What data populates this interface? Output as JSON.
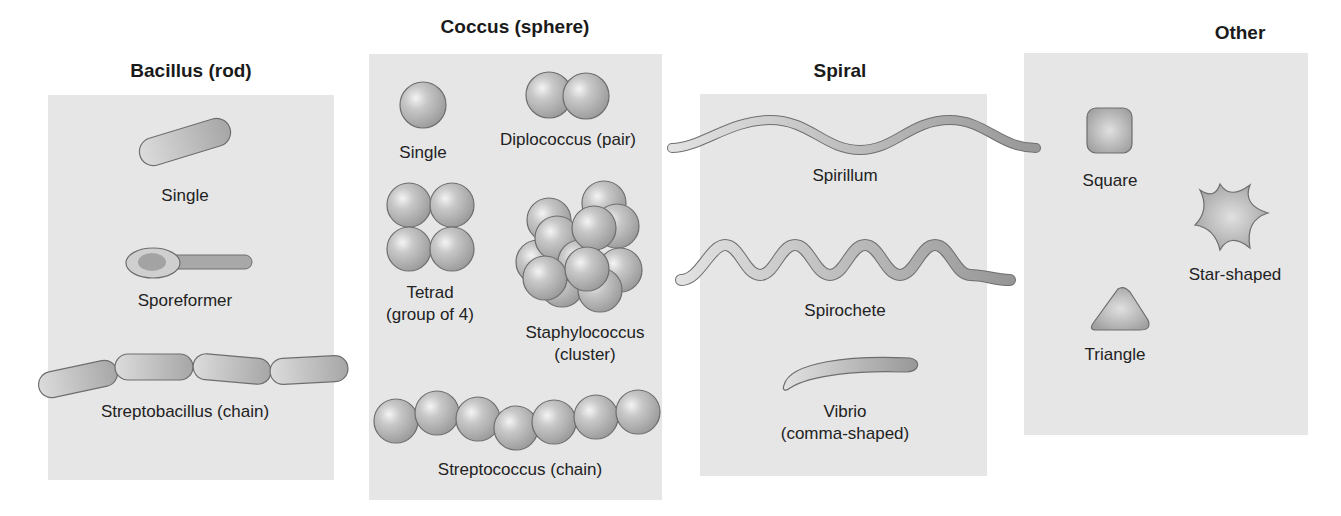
{
  "groups": [
    {
      "title": "Bacillus (rod)",
      "items": [
        {
          "label": "Single"
        },
        {
          "label": "Sporeformer"
        },
        {
          "label": "Streptobacillus (chain)"
        }
      ]
    },
    {
      "title": "Coccus (sphere)",
      "items": [
        {
          "label": "Single"
        },
        {
          "label": "Diplococcus (pair)"
        },
        {
          "label_line1": "Tetrad",
          "label_line2": "(group of 4)"
        },
        {
          "label_line1": "Staphylococcus",
          "label_line2": "(cluster)"
        },
        {
          "label": "Streptococcus (chain)"
        }
      ]
    },
    {
      "title": "Spiral",
      "items": [
        {
          "label": "Spirillum"
        },
        {
          "label": "Spirochete"
        },
        {
          "label_line1": "Vibrio",
          "label_line2": "(comma-shaped)"
        }
      ]
    },
    {
      "title": "Other",
      "items": [
        {
          "label": "Square"
        },
        {
          "label": "Star-shaped"
        },
        {
          "label": "Triangle"
        }
      ]
    }
  ],
  "colors": {
    "panel_bg": "#e6e6e6",
    "cell_fill": "#b8b8b8",
    "cell_outline": "#6e6e6e"
  }
}
